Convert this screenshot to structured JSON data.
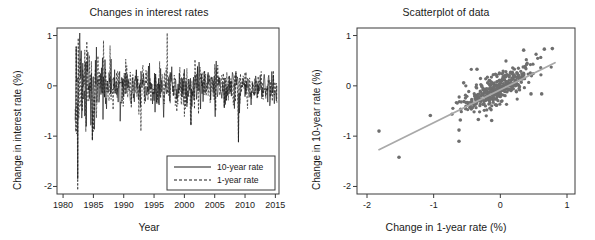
{
  "figure": {
    "panels": [
      {
        "key": "timeseries",
        "title": "Changes in interest rates"
      },
      {
        "key": "scatter",
        "title": "Scatterplot of data"
      }
    ]
  },
  "chart_data": [
    {
      "type": "line",
      "title": "Changes in interest rates",
      "xlabel": "Year",
      "ylabel": "Change in interest rate (%)",
      "xlim": [
        1979,
        2015.6
      ],
      "ylim": [
        -2.15,
        1.15
      ],
      "xticks": [
        1980,
        1985,
        1990,
        1995,
        2000,
        2005,
        2010,
        2015
      ],
      "xticklabels": [
        "1980",
        "1985",
        "1990",
        "1995",
        "2000",
        "2005",
        "2010",
        "2015"
      ],
      "yticks": [
        1,
        0,
        -1,
        -2
      ],
      "yticklabels": [
        "1",
        "0",
        "-1",
        "-2"
      ],
      "grid": false,
      "legend_position": "lower right",
      "series": [
        {
          "name": "10-year rate",
          "style": "solid",
          "color": "#1a1a1a",
          "description": "Monthly change in 10-year Treasury rate, 1982-2015. High volatility 1982-1985 with extremes near -1.8 and +0.8, declining amplitude after 1990, mostly within -0.5 to +0.5 after 1995."
        },
        {
          "name": "1-year rate",
          "style": "dashed",
          "color": "#1a1a1a",
          "description": "Monthly change in 1-year Treasury rate, same window; tracks the 10-year series closely with larger early-1980s swings."
        }
      ],
      "annotations": {
        "extreme_low": {
          "year": 1982.4,
          "value": -1.85
        },
        "extreme_high": {
          "year": 1982.2,
          "value": 0.78
        },
        "notable_dips": [
          {
            "year": 1984.8,
            "value": -1.08
          },
          {
            "year": 2001.1,
            "value": -0.78
          },
          {
            "year": 2008.9,
            "value": -1.12
          }
        ]
      }
    },
    {
      "type": "scatter",
      "title": "Scatterplot of data",
      "xlabel": "Change in 1-year rate (%)",
      "ylabel": "Change in 10-year rate (%)",
      "xlim": [
        -2.15,
        1.12
      ],
      "ylim": [
        -2.15,
        1.15
      ],
      "xticks": [
        -2,
        -1,
        0,
        1
      ],
      "xticklabels": [
        "-2",
        "-1",
        "0",
        "1"
      ],
      "yticks": [
        1,
        0,
        -1,
        -2
      ],
      "yticklabels": [
        "1",
        "0",
        "-1",
        "-2"
      ],
      "grid": false,
      "marker_color": "#6e6e6e",
      "fit_line_color": "#a9a9a9",
      "fit_line": {
        "x": [
          -1.82,
          0.82
        ],
        "y": [
          -1.27,
          0.46
        ],
        "slope": 0.655,
        "intercept": -0.08
      },
      "n_points": 390,
      "cluster": {
        "center": [
          -0.02,
          -0.04
        ],
        "sd_x": 0.26,
        "sd_y": 0.22,
        "correlation": 0.78
      },
      "outliers": [
        [
          -1.82,
          -0.9
        ],
        [
          -1.52,
          -1.42
        ],
        [
          -1.05,
          -0.59
        ],
        [
          -0.62,
          -0.88
        ],
        [
          -0.62,
          -1.1
        ],
        [
          -0.6,
          -0.68
        ],
        [
          -0.33,
          -0.67
        ],
        [
          -0.13,
          -0.69
        ],
        [
          0.46,
          -0.16
        ],
        [
          0.62,
          -0.16
        ],
        [
          0.35,
          0.71
        ],
        [
          0.66,
          0.73
        ],
        [
          0.78,
          0.74
        ],
        [
          -0.35,
          0.33
        ],
        [
          -0.55,
          0.06
        ]
      ]
    }
  ]
}
